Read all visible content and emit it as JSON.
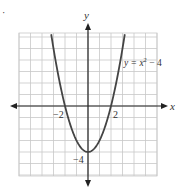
{
  "chart_data": {
    "type": "line",
    "title": "",
    "xlabel": "x",
    "ylabel": "y",
    "xlim": [
      -6,
      6
    ],
    "ylim": [
      -6,
      6
    ],
    "grid": true,
    "series": [
      {
        "name": "y = x² − 4",
        "x": [
          -3.2,
          -3,
          -2.5,
          -2,
          -1.5,
          -1,
          -0.5,
          0,
          0.5,
          1,
          1.5,
          2,
          2.5,
          3,
          3.2
        ],
        "values": [
          6.24,
          5,
          2.25,
          0,
          -1.75,
          -3,
          -3.75,
          -4,
          -3.75,
          -3,
          -1.75,
          0,
          2.25,
          5,
          6.24
        ]
      }
    ],
    "annotations": [
      {
        "text": "y = x² − 4",
        "x": 3.5,
        "y": 4.5
      },
      {
        "text": "−2",
        "x": -2,
        "y": -0.5
      },
      {
        "text": "2",
        "x": 2,
        "y": -0.5
      },
      {
        "text": "−4",
        "x": -0.6,
        "y": -4.4
      }
    ],
    "tick_labels": {
      "x": [
        "−2",
        "2"
      ],
      "y": [
        "−4"
      ]
    }
  },
  "labels": {
    "bullet": "·",
    "x_axis": "x",
    "y_axis": "y",
    "equation_prefix": "y = x",
    "equation_exp": "2",
    "equation_suffix": " − 4",
    "tick_neg2": "−2",
    "tick_2": "2",
    "tick_neg4": "−4"
  }
}
